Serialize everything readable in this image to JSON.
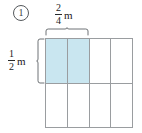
{
  "problem": {
    "number": "1",
    "number_style": "circled"
  },
  "labels": {
    "width": {
      "numerator": "2",
      "denominator": "4",
      "unit": "m",
      "text": "2/4 m"
    },
    "height": {
      "numerator": "1",
      "denominator": "2",
      "unit": "m",
      "text": "1/2 m"
    }
  },
  "grid": {
    "columns": 4,
    "rows": 2,
    "shaded_count": 2,
    "cells": [
      {
        "shaded": true
      },
      {
        "shaded": true
      },
      {
        "shaded": false
      },
      {
        "shaded": false
      },
      {
        "shaded": false
      },
      {
        "shaded": false
      },
      {
        "shaded": false
      },
      {
        "shaded": false
      }
    ]
  },
  "colors": {
    "shaded_fill": "#c9e6f0",
    "grid_line": "#9a9da0",
    "brace": "#6f7376",
    "background": "#ffffff",
    "text": "#1a1a1a"
  },
  "icons": {
    "top_brace": "curly-brace-horizontal",
    "left_brace": "curly-brace-vertical"
  }
}
